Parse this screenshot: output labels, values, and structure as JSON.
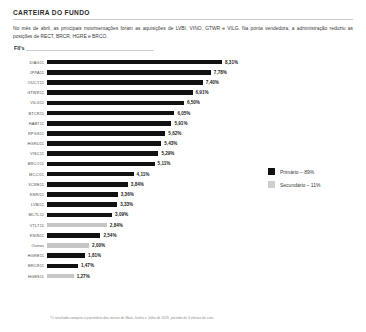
{
  "section": {
    "title": "CARTEIRA DO FUNDO",
    "paragraph": "No mês de abril, as principais movimentações foram as aquisições de LVBI, VINO, GTWR e VILG. Na ponta vendedora, a administração reduziu as posições de RECT, BRCR, HGRE e BRCO.",
    "chart_label": "FII's",
    "footnote": "*O resultado computa o patrimônio dos meses de Maio, Junho e Julho de 2019, período de 3 ofertas de cota."
  },
  "legend": {
    "items": [
      {
        "label": "Primário – 89%",
        "type": "primary",
        "color": "#111111"
      },
      {
        "label": "Secundário – 11%",
        "type": "secondary",
        "color": "#cfcfcf"
      }
    ]
  },
  "chart_data": {
    "type": "bar",
    "orientation": "horizontal",
    "title": "FII's",
    "xlabel": "",
    "ylabel": "",
    "xlim": [
      0,
      8.31
    ],
    "grid": false,
    "legend_position": "right",
    "value_suffix": "%",
    "categories": [
      "DIAG11",
      "JPPA11",
      "OUCY11",
      "GTWR11",
      "VILG11",
      "BTCR11",
      "HABT11",
      "RPGS11",
      "HGRU11",
      "VISC11",
      "BRCO11",
      "MCCI11",
      "XCRE11",
      "KNRI11",
      "LVBI11",
      "MCTL11",
      "VTLT11",
      "KNIN11",
      "Outros",
      "HGRE11",
      "BRCR11",
      "HGBS11"
    ],
    "values": [
      8.31,
      7.78,
      7.4,
      6.91,
      6.5,
      6.05,
      5.91,
      5.62,
      5.43,
      5.29,
      5.11,
      4.11,
      3.84,
      3.36,
      3.33,
      3.09,
      2.84,
      2.54,
      2.0,
      1.81,
      1.47,
      1.27
    ],
    "value_labels": [
      "8,31%",
      "7,78%",
      "7,40%",
      "6,91%",
      "6,50%",
      "6,05%",
      "5,91%",
      "5,62%",
      "5,43%",
      "5,29%",
      "5,11%",
      "4,11%",
      "3,84%",
      "3,36%",
      "3,33%",
      "3,09%",
      "2,84%",
      "2,54%",
      "2,00%",
      "1,81%",
      "1,47%",
      "1,27%"
    ],
    "series_type": [
      "primary",
      "primary",
      "primary",
      "primary",
      "primary",
      "primary",
      "primary",
      "primary",
      "primary",
      "primary",
      "primary",
      "primary",
      "primary",
      "primary",
      "primary",
      "primary",
      "secondary",
      "primary",
      "secondary",
      "primary",
      "primary",
      "secondary"
    ]
  }
}
